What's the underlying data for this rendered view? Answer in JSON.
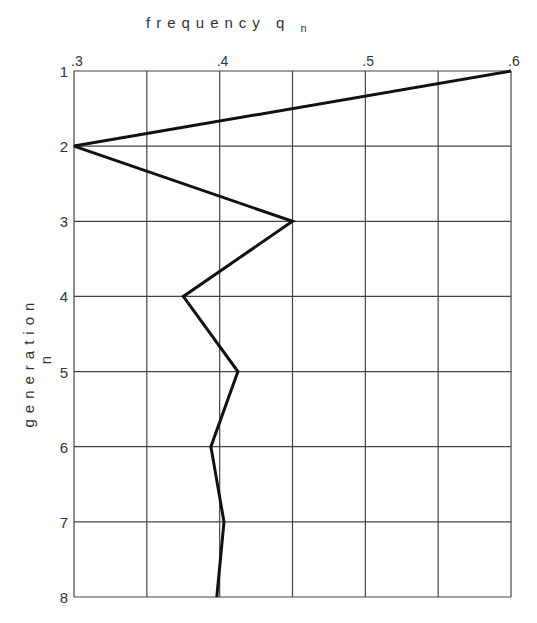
{
  "chart_data": {
    "type": "line",
    "xlabel": "frequency q_n",
    "ylabel": "generation n",
    "x_axis_position": "top",
    "y_axis_inverted": true,
    "xlim": [
      0.3,
      0.6
    ],
    "ylim": [
      1,
      8
    ],
    "x_ticks": [
      ".3",
      ".4",
      ".5",
      ".6"
    ],
    "x_gridlines": [
      0.3,
      0.35,
      0.4,
      0.45,
      0.5,
      0.55,
      0.6
    ],
    "y_ticks": [
      "1",
      "2",
      "3",
      "4",
      "5",
      "6",
      "7",
      "8"
    ],
    "grid": true,
    "legend": null,
    "series": [
      {
        "name": "q_n",
        "generation": [
          1,
          2,
          3,
          4,
          5,
          6,
          7,
          8
        ],
        "frequency": [
          0.6,
          0.3,
          0.45,
          0.375,
          0.4125,
          0.394,
          0.403,
          0.398
        ]
      }
    ]
  },
  "labels": {
    "title_main": "frequency q",
    "title_sub": "n",
    "ylabel_main": "generation",
    "ylabel_sub": "n"
  }
}
